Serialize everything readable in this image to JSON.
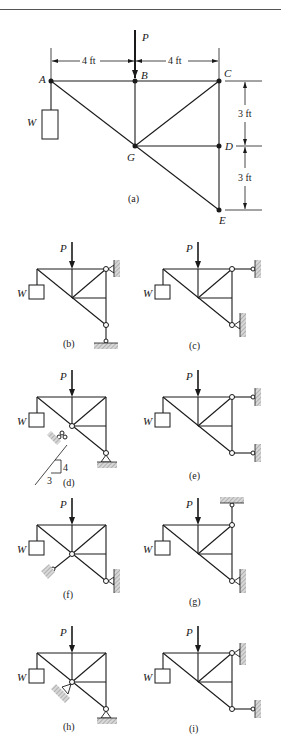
{
  "figure": {
    "main": {
      "caption": "(a)",
      "joints": [
        "A",
        "B",
        "C",
        "D",
        "E",
        "G"
      ],
      "load_label": "P",
      "weight_label": "W",
      "dimensions": {
        "horizontal": [
          "4 ft",
          "4 ft"
        ],
        "vertical": [
          "3 ft",
          "3 ft"
        ]
      }
    },
    "variants": [
      {
        "caption": "(b)",
        "load_label": "P",
        "weight_label": "W"
      },
      {
        "caption": "(c)",
        "load_label": "P",
        "weight_label": "W"
      },
      {
        "caption": "(d)",
        "load_label": "P",
        "weight_label": "W",
        "slope": {
          "rise": "4",
          "run": "3"
        }
      },
      {
        "caption": "(e)",
        "load_label": "P",
        "weight_label": "W"
      },
      {
        "caption": "(f)",
        "load_label": "P",
        "weight_label": "W"
      },
      {
        "caption": "(g)",
        "load_label": "P",
        "weight_label": "W"
      },
      {
        "caption": "(h)",
        "load_label": "P",
        "weight_label": "W"
      },
      {
        "caption": "(i)",
        "load_label": "P",
        "weight_label": "W"
      }
    ]
  }
}
